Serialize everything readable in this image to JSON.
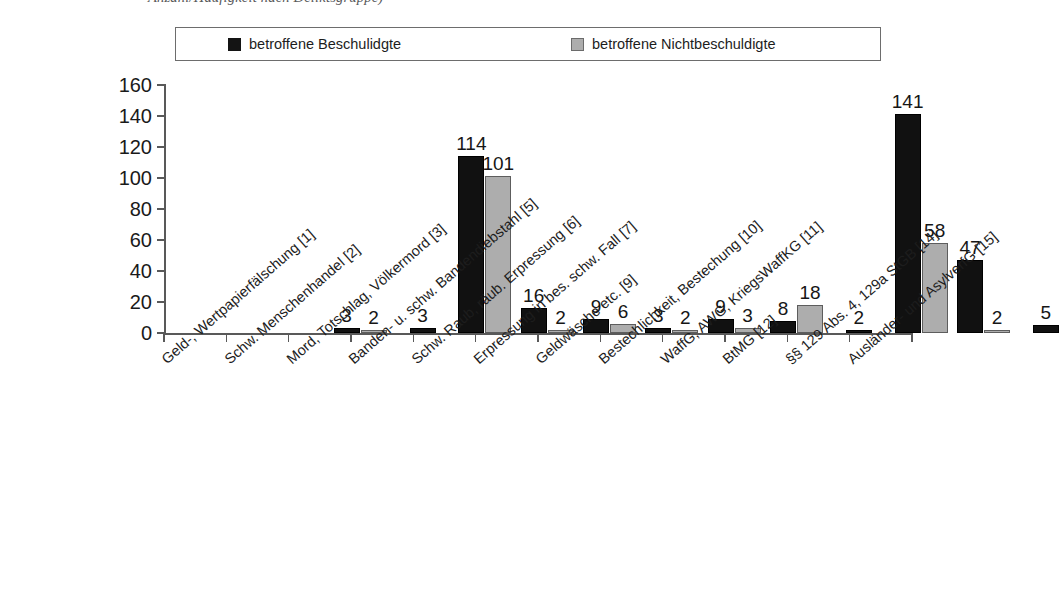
{
  "caption": {
    "text": "Anzahl/Häufigkeit nach Deliktsgruppe)"
  },
  "legend": {
    "entries": [
      {
        "label": "betroffene Beschulidgte",
        "swatch": "dark-square-swatch",
        "color": "#141414"
      },
      {
        "label": "betroffene Nichtbeschuldigte",
        "swatch": "light-square-swatch",
        "color": "#adadad"
      }
    ]
  },
  "chart_data": {
    "type": "bar",
    "title": "",
    "xlabel": "",
    "ylabel": "",
    "ylim": [
      0,
      160
    ],
    "yticks": [
      0,
      20,
      40,
      60,
      80,
      100,
      120,
      140,
      160
    ],
    "grid": false,
    "legend_position": "top",
    "categories": [
      "Geld-, Wertpapierfälschung [1]",
      "Schw. Menschenhandel [2]",
      "Mord, Totschlag, Völkermord [3]",
      "Banden- u. schw. Bandendiebstahl [5]",
      "Schw. Raub, räub. Erpressung [6]",
      "Erpressung in bes. schw. Fall [7]",
      "Geldwäsche etc. [9]",
      "Bestechlichkeit, Bestechung [10]",
      "WaffG, AWG, KriegsWaffKG [11]",
      "BtMG [12]",
      "§§ 129 Abs. 4, 129a StGB [14]",
      "Ausländer- und AsylverfG [15]"
    ],
    "series": [
      {
        "name": "betroffene Beschulidgte",
        "color": "#111111",
        "values": [
          3,
          3,
          114,
          16,
          9,
          3,
          9,
          8,
          2,
          141,
          47,
          5
        ]
      },
      {
        "name": "betroffene Nichtbeschuldigte",
        "color": "#adadad",
        "values": [
          2,
          null,
          101,
          2,
          6,
          2,
          3,
          18,
          null,
          58,
          2,
          null
        ]
      }
    ]
  }
}
